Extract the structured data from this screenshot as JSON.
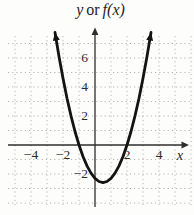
{
  "title": {
    "y": "y",
    "or": "or",
    "fx": "f(x)"
  },
  "axes": {
    "x_label": "x",
    "x_ticks": [
      {
        "value": -4,
        "label": "−4"
      },
      {
        "value": -2,
        "label": "−2"
      },
      {
        "value": 2,
        "label": "2"
      },
      {
        "value": 4,
        "label": "4"
      }
    ],
    "y_ticks": [
      {
        "value": 6,
        "label": "6"
      },
      {
        "value": 4,
        "label": "4"
      },
      {
        "value": 2,
        "label": "2"
      },
      {
        "value": -2,
        "label": "−2"
      }
    ]
  },
  "colors": {
    "background": "#fdfdfc",
    "curve": "#131313",
    "axis": "#2e2e2e",
    "grid": "#b5b5b5",
    "text": "#2b2b2b"
  },
  "chart_data": {
    "type": "line",
    "xlabel": "x",
    "ylabel": "y or f(x)",
    "xlim": [
      -5.5,
      6
    ],
    "ylim": [
      -4.5,
      8.1
    ],
    "x_tick_values": [
      -4,
      -2,
      2,
      4
    ],
    "y_tick_values": [
      6,
      4,
      2,
      -2
    ],
    "grid": "dotted, 1-unit spacing",
    "legend": "none",
    "series": [
      {
        "name": "upward-opening parabola",
        "points": [
          [
            -2.5,
            7.76
          ],
          [
            -2.25,
            6.11
          ],
          [
            -2,
            4.6
          ],
          [
            -1.75,
            3.23
          ],
          [
            -1.5,
            2.01
          ],
          [
            -1.25,
            0.93
          ],
          [
            -1,
            0
          ],
          [
            -0.75,
            -0.79
          ],
          [
            -0.5,
            -1.44
          ],
          [
            -0.25,
            -1.94
          ],
          [
            0,
            -2.3
          ],
          [
            0.25,
            -2.52
          ],
          [
            0.5,
            -2.59
          ],
          [
            0.75,
            -2.52
          ],
          [
            1,
            -2.3
          ],
          [
            1.25,
            -1.94
          ],
          [
            1.5,
            -1.44
          ],
          [
            1.75,
            -0.79
          ],
          [
            2,
            0
          ],
          [
            2.25,
            0.93
          ],
          [
            2.5,
            2.01
          ],
          [
            2.75,
            3.23
          ],
          [
            3,
            4.6
          ],
          [
            3.25,
            6.11
          ],
          [
            3.5,
            7.76
          ]
        ]
      }
    ],
    "features": {
      "opens": "up",
      "x_intercepts": [
        -1,
        2
      ],
      "y_intercept": -2.3,
      "vertex": [
        0.5,
        -2.6
      ],
      "curve_end_arrows": true,
      "axis_arrows": [
        "x-right",
        "y-top"
      ]
    }
  }
}
